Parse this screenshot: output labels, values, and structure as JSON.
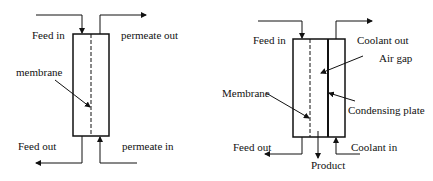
{
  "left_diagram": {
    "name": "direct-contact-membrane-distillation",
    "labels": {
      "feed_in": "Feed in",
      "permeate_out": "permeate out",
      "membrane": "membrane",
      "feed_out": "Feed out",
      "permeate_in": "permeate in"
    }
  },
  "right_diagram": {
    "name": "air-gap-membrane-distillation",
    "labels": {
      "feed_in": "Feed in",
      "coolant_out": "Coolant out",
      "air_gap": "Air gap",
      "membrane": "Membrane",
      "condensing_plate": "Condensing plate",
      "feed_out": "Feed out",
      "coolant_in": "Coolant in",
      "product": "Product"
    }
  },
  "colors": {
    "line": "#111111",
    "background": "#ffffff"
  }
}
